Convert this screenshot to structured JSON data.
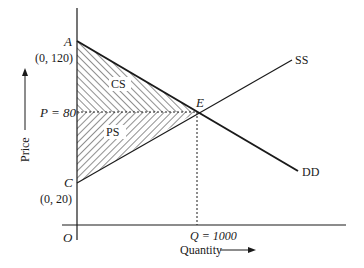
{
  "diagram": {
    "axes": {
      "x_label": "Quantity",
      "y_label": "Price",
      "origin_label": "O"
    },
    "points": {
      "A": {
        "label": "A",
        "coord_label": "(0, 120)",
        "price": 120,
        "quantity": 0
      },
      "C": {
        "label": "C",
        "coord_label": "(0, 20)",
        "price": 20,
        "quantity": 0
      },
      "E": {
        "label": "E",
        "price": 80,
        "quantity": 1000
      }
    },
    "equilibrium": {
      "price_label": "P = 80",
      "quantity_label": "Q = 1000",
      "price": 80,
      "quantity": 1000
    },
    "curves": {
      "supply": {
        "label": "SS"
      },
      "demand": {
        "label": "DD"
      }
    },
    "regions": {
      "consumer_surplus": {
        "label": "CS"
      },
      "producer_surplus": {
        "label": "PS"
      }
    },
    "colors": {
      "ink": "#1a1a1a",
      "hatch": "#444444",
      "background": "#ffffff"
    }
  }
}
